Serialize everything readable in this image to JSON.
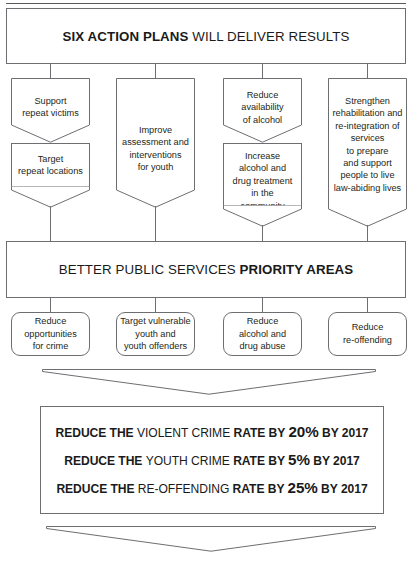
{
  "header": {
    "bold": "SIX ACTION PLANS",
    "rest": " WILL DELIVER RESULTS"
  },
  "action_plans": [
    {
      "top_label": "Support\nrepeat victims",
      "bottom_label": "Target\nrepeat locations",
      "has_bottom": true
    },
    {
      "top_label": "Improve\nassessment and\ninterventions\nfor youth",
      "bottom_label": "",
      "has_bottom": false
    },
    {
      "top_label": "Reduce\navailability\nof alcohol",
      "bottom_label": "Increase\nalcohol and\ndrug treatment\nin the\ncommunity",
      "has_bottom": true
    },
    {
      "top_label": "Strengthen\nrehabilitation and\nre-integration of\nservices\nto prepare\nand support\npeople to live\nlaw-abiding lives",
      "bottom_label": "",
      "has_bottom": false
    }
  ],
  "priority_banner": {
    "regular": "BETTER PUBLIC SERVICES ",
    "bold": "PRIORITY AREAS"
  },
  "priority_areas": [
    {
      "label": "Reduce\nopportunities\nfor crime"
    },
    {
      "label": "Target vulnerable\nyouth and\nyouth offenders"
    },
    {
      "label": "Reduce\nalcohol and\ndrug abuse"
    },
    {
      "label": "Reduce\nre-offending"
    }
  ],
  "results": [
    {
      "bold1": "REDUCE THE ",
      "regular": "VIOLENT CRIME ",
      "bold2": "RATE BY ",
      "big": "20%",
      "bold3": " BY 2017"
    },
    {
      "bold1": "REDUCE THE ",
      "regular": "YOUTH CRIME ",
      "bold2": "RATE BY ",
      "big": "5%",
      "bold3": " BY 2017"
    },
    {
      "bold1": "REDUCE THE ",
      "regular": "RE-OFFENDING ",
      "bold2": "RATE BY ",
      "big": "25%",
      "bold3": " BY 2017"
    }
  ],
  "colors": {
    "stroke": "#6d6e71",
    "text": "#231f20",
    "background": "#ffffff"
  }
}
